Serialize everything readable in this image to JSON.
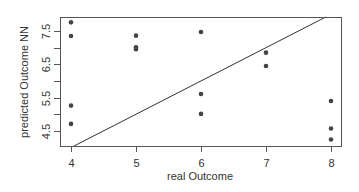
{
  "chart_data": {
    "type": "scatter",
    "title": "",
    "xlabel": "real Outcome",
    "ylabel": "predicted Outcome NN",
    "xlim": [
      3.83,
      8.15
    ],
    "ylim": [
      4.05,
      7.92
    ],
    "x_ticks": [
      4,
      5,
      6,
      7,
      8
    ],
    "x_tick_labels": [
      "4",
      "5",
      "6",
      "7",
      "8"
    ],
    "y_ticks": [
      4.5,
      5.0,
      5.5,
      6.0,
      6.5,
      7.0,
      7.5
    ],
    "y_tick_labels": [
      "4.5",
      "",
      "5.5",
      "",
      "6.5",
      "",
      "7.5"
    ],
    "grid": false,
    "legend": null,
    "series": [
      {
        "name": "observations",
        "marker": "filled-circle",
        "color": "#444444",
        "points": [
          {
            "x": 4,
            "y": 7.76
          },
          {
            "x": 4,
            "y": 7.35
          },
          {
            "x": 4,
            "y": 5.26
          },
          {
            "x": 4,
            "y": 4.71
          },
          {
            "x": 5,
            "y": 7.36
          },
          {
            "x": 5,
            "y": 7.01
          },
          {
            "x": 5,
            "y": 6.95
          },
          {
            "x": 6,
            "y": 7.47
          },
          {
            "x": 6,
            "y": 5.61
          },
          {
            "x": 6,
            "y": 5.01
          },
          {
            "x": 7,
            "y": 6.85
          },
          {
            "x": 7,
            "y": 6.45
          },
          {
            "x": 8,
            "y": 5.4
          },
          {
            "x": 8,
            "y": 4.57
          },
          {
            "x": 8,
            "y": 4.24
          }
        ]
      }
    ],
    "reference_line": {
      "type": "abline",
      "intercept": 0,
      "slope": 1,
      "color": "#333333"
    }
  },
  "layout": {
    "plot_box": {
      "left": 60,
      "top": 17,
      "right": 341,
      "bottom": 146
    },
    "x_map": {
      "v0": 4,
      "px0": 71,
      "px_per_unit": 65
    },
    "y_map": {
      "v0": 7.5,
      "px0": 31,
      "px_per_unit": 33.3
    }
  }
}
